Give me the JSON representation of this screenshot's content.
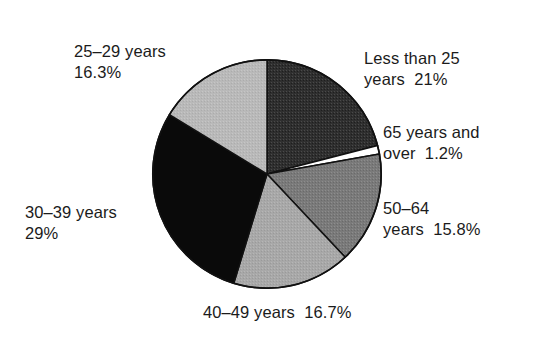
{
  "chart_data": {
    "type": "pie",
    "title": "",
    "subtitle": "",
    "xlabel": "",
    "ylabel": "",
    "legend_position": "none",
    "grid": false,
    "start_angle_deg": 0,
    "direction": "clockwise",
    "units": "percent",
    "categories": [
      "Less than 25 years",
      "65 years and over",
      "50–64 years",
      "40–49 years",
      "30–39 years",
      "25–29 years"
    ],
    "values": [
      21,
      1.2,
      15.8,
      16.7,
      29,
      16.3
    ],
    "slices": [
      {
        "id": "less-than-25",
        "category": "Less than 25 years",
        "value": 21,
        "value_text": "21%",
        "label_line1": "Less than 25",
        "label_line2": "years  21%",
        "color": "#2f2f2f",
        "start_deg": 0,
        "end_deg": 75.6
      },
      {
        "id": "65-and-over",
        "category": "65 years and over",
        "value": 1.2,
        "value_text": "1.2%",
        "label_line1": "65 years and",
        "label_line2": "over  1.2%",
        "color": "#ffffff",
        "start_deg": 75.6,
        "end_deg": 79.92
      },
      {
        "id": "50-64",
        "category": "50–64 years",
        "value": 15.8,
        "value_text": "15.8%",
        "label_line1": "50–64",
        "label_line2": "years  15.8%",
        "color": "#7a7a7a",
        "start_deg": 79.92,
        "end_deg": 136.8
      },
      {
        "id": "40-49",
        "category": "40–49 years",
        "value": 16.7,
        "value_text": "16.7%",
        "label_line1": "40–49 years  16.7%",
        "label_line2": "",
        "color": "#a8a8a8",
        "start_deg": 136.8,
        "end_deg": 196.92
      },
      {
        "id": "30-39",
        "category": "30–39 years",
        "value": 29,
        "value_text": "29%",
        "label_line1": "30–39 years",
        "label_line2": "29%",
        "color": "#0a0a0a",
        "start_deg": 196.92,
        "end_deg": 301.32
      },
      {
        "id": "25-29",
        "category": "25–29 years",
        "value": 16.3,
        "value_text": "16.3%",
        "label_line1": "25–29 years",
        "label_line2": "16.3%",
        "color": "#b9b9b9",
        "start_deg": 301.32,
        "end_deg": 360
      }
    ]
  },
  "figure": {
    "background_color": "#ffffff",
    "outline_color": "#111111"
  }
}
